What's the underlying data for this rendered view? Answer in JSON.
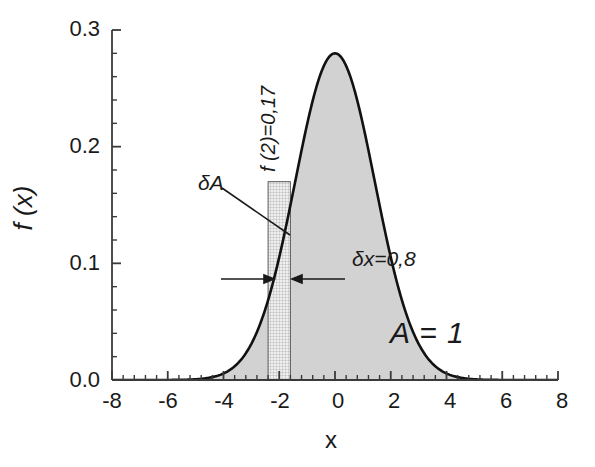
{
  "chart_data": {
    "type": "area",
    "title": "",
    "subtitle": "",
    "xlabel": "x",
    "ylabel": "f (x)",
    "xlim": [
      -8,
      8
    ],
    "ylim": [
      0.0,
      0.3
    ],
    "grid": false,
    "legend": null,
    "legend_position": "none",
    "curve": {
      "name": "f(x)",
      "distribution": "gaussian",
      "mean": 0,
      "sigma": 1.43,
      "peak_value": 0.28,
      "fill_color": "#d2d2d2",
      "line_color": "#111111",
      "x": [
        -8,
        -7.5,
        -7,
        -6.5,
        -6,
        -5.5,
        -5,
        -4.5,
        -4,
        -3.5,
        -3,
        -2.5,
        -2,
        -1.5,
        -1,
        -0.5,
        0,
        0.5,
        1,
        1.5,
        2,
        2.5,
        3,
        3.5,
        4,
        4.5,
        5,
        5.5,
        6,
        6.5,
        7,
        7.5,
        8
      ],
      "y": [
        0.0,
        0.0,
        0.001,
        0.002,
        0.005,
        0.01,
        0.02,
        0.035,
        0.057,
        0.085,
        0.115,
        0.146,
        0.172,
        0.218,
        0.249,
        0.271,
        0.28,
        0.271,
        0.249,
        0.218,
        0.172,
        0.146,
        0.115,
        0.085,
        0.057,
        0.035,
        0.02,
        0.01,
        0.005,
        0.002,
        0.001,
        0.0,
        0.0
      ]
    },
    "strip": {
      "label": "δA",
      "x_center": -2,
      "x_left": -2.4,
      "x_right": -1.6,
      "width": 0.8,
      "height": 0.17,
      "fill": "hatched-grid"
    },
    "xticks": [
      "-8",
      "-6",
      "-4",
      "-2",
      "0",
      "2",
      "4",
      "6",
      "8"
    ],
    "xtick_values": [
      -8,
      -6,
      -4,
      -2,
      0,
      2,
      4,
      6,
      8
    ],
    "yticks": [
      "0.0",
      "0.1",
      "0.2",
      "0.3"
    ],
    "ytick_values": [
      0.0,
      0.1,
      0.2,
      0.3
    ],
    "minor_ticks_per_interval": 5,
    "annotations": [
      {
        "name": "delta-area",
        "text": "δA",
        "x": -3.2,
        "y": 0.158,
        "style": "italic"
      },
      {
        "name": "f-of-2",
        "text": "f (2)=0,17",
        "x": -2.35,
        "y": 0.215,
        "rotation": -90,
        "style": "italic"
      },
      {
        "name": "delta-x",
        "text": "δx=0,8",
        "x": -0.9,
        "y": 0.098,
        "style": "italic"
      },
      {
        "name": "total-area",
        "text": "A = 1",
        "x": 1.55,
        "y": 0.028,
        "style": "italic"
      }
    ]
  },
  "axes": {
    "y_title": "f (x)",
    "x_title": "x"
  },
  "labels": {
    "delta_area": "δA",
    "f_of_two": "f (2)=0,17",
    "delta_x": "δx=0,8",
    "total_area": "A = 1"
  },
  "colors": {
    "curve_line": "#111111",
    "curve_fill": "#d2d2d2",
    "axis": "#3a3a3a",
    "text": "#1a1a1a",
    "strip_fill": "#ededed",
    "strip_hatch": "#9a9a9a"
  }
}
